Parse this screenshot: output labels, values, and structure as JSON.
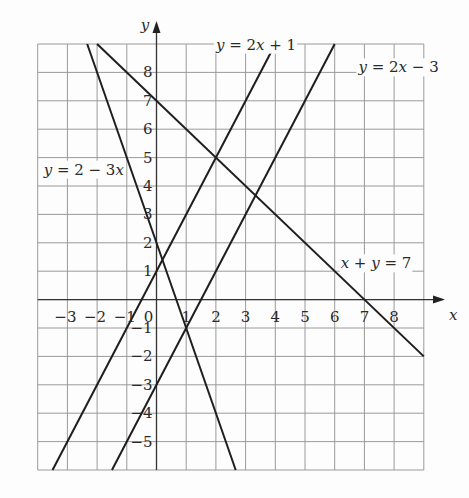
{
  "chart_data": {
    "type": "line",
    "title": "",
    "xlabel": "x",
    "ylabel": "y",
    "xlim": [
      -4,
      9
    ],
    "ylim": [
      -6,
      9
    ],
    "grid": true,
    "x_ticks": [
      -3,
      -2,
      -1,
      0,
      1,
      2,
      3,
      4,
      5,
      6,
      7,
      8
    ],
    "y_ticks": [
      -5,
      -4,
      -3,
      -2,
      -1,
      1,
      2,
      3,
      4,
      5,
      6,
      7,
      8
    ],
    "series": [
      {
        "name": "y = 2x + 1",
        "slope": 2,
        "intercept": 1
      },
      {
        "name": "y = 2x − 3",
        "slope": 2,
        "intercept": -3
      },
      {
        "name": "y = 2 − 3x",
        "slope": -3,
        "intercept": 2
      },
      {
        "name": "x + y = 7",
        "slope": -1,
        "intercept": 7
      }
    ],
    "annotations": [
      {
        "text": "y = 2x + 1",
        "x": 2.0,
        "y": 8.8
      },
      {
        "text": "y = 2x − 3",
        "x": 6.8,
        "y": 8.0
      },
      {
        "text": "y = 2 − 3x",
        "x": -3.8,
        "y": 4.4
      },
      {
        "text": "x + y = 7",
        "x": 6.2,
        "y": 1.1
      }
    ],
    "intersections": [
      {
        "x": 2,
        "y": 5
      },
      {
        "x": 1,
        "y": -1
      },
      {
        "x": 0.2,
        "y": 1.4
      },
      {
        "x": 3.33,
        "y": 3.67
      }
    ]
  }
}
